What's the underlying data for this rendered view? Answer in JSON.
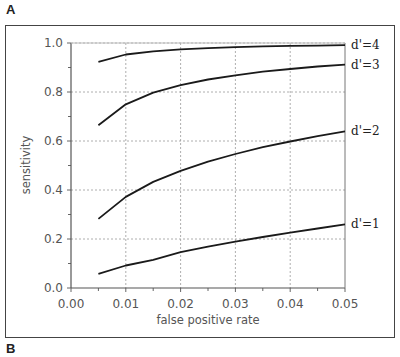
{
  "panels": {
    "top_label": "A",
    "bottom_label": "B"
  },
  "chart_data": {
    "type": "line",
    "title": "",
    "xlabel": "false positive rate",
    "ylabel": "sensitivity",
    "xlim": [
      0.0,
      0.05
    ],
    "ylim": [
      0.0,
      1.0
    ],
    "xticks": [
      "0.00",
      "0.01",
      "0.02",
      "0.03",
      "0.04",
      "0.05"
    ],
    "yticks": [
      "0.0",
      "0.2",
      "0.4",
      "0.6",
      "0.8",
      "1.0"
    ],
    "grid": true,
    "legend_position": "inline-right",
    "x": [
      0.005,
      0.01,
      0.015,
      0.02,
      0.025,
      0.03,
      0.035,
      0.04,
      0.045,
      0.05
    ],
    "series": [
      {
        "name": "d'=4",
        "values": [
          0.923,
          0.953,
          0.966,
          0.974,
          0.979,
          0.983,
          0.986,
          0.988,
          0.989,
          0.991
        ]
      },
      {
        "name": "d'=3",
        "values": [
          0.664,
          0.75,
          0.797,
          0.828,
          0.851,
          0.868,
          0.883,
          0.894,
          0.904,
          0.912
        ]
      },
      {
        "name": "d'=2",
        "values": [
          0.282,
          0.372,
          0.433,
          0.478,
          0.516,
          0.547,
          0.575,
          0.598,
          0.62,
          0.639
        ]
      },
      {
        "name": "d'=1",
        "values": [
          0.058,
          0.092,
          0.115,
          0.146,
          0.169,
          0.189,
          0.208,
          0.226,
          0.243,
          0.26
        ]
      }
    ]
  }
}
